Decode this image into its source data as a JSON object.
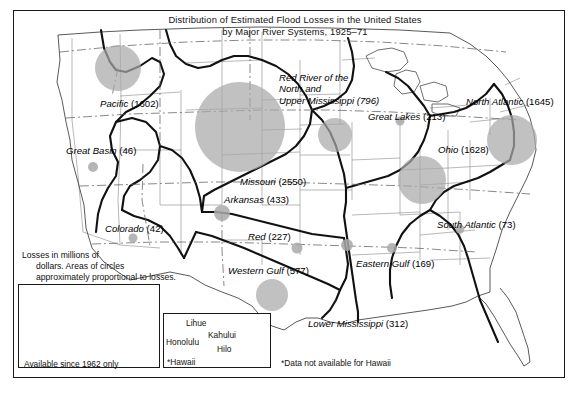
{
  "title": {
    "line1": "Distribution of Estimated Flood Losses in the United States",
    "line2": "by Major River Systems, 1925–71"
  },
  "legend": {
    "line1": "Losses in millions of",
    "line2": "dollars.  Areas of circles",
    "line3": "approximately proportional to losses."
  },
  "insets": {
    "alaska": {
      "region_label": "Alaska",
      "value_label": "(110)",
      "caption": "Available since 1962 only"
    },
    "hawaii": {
      "caption": "*Hawaii",
      "cities": [
        {
          "name": "Lihue"
        },
        {
          "name": "Honolulu"
        },
        {
          "name": "Kahului"
        },
        {
          "name": "Hilo"
        }
      ]
    }
  },
  "footnote": "*Data not available for Hawaii",
  "colors": {
    "circle_fill": "#a9a9a9",
    "frame": "#1a1a1a",
    "basin_line": "#141414",
    "state_line": "#6f6f6f",
    "text": "#000000"
  },
  "chart_data": {
    "type": "map",
    "title": "Distribution of Estimated Flood Losses in the United States by Major River Systems, 1925–71",
    "units": "millions of dollars",
    "encoding": "circle area proportional to losses",
    "categories": [
      "Pacific",
      "Great Basin",
      "Colorado",
      "Missouri",
      "Arkansas",
      "Red",
      "Western Gulf",
      "Red River of the North and Upper Mississippi",
      "Great Lakes",
      "Ohio",
      "North Atlantic",
      "South Atlantic",
      "Eastern Gulf",
      "Lower Mississippi",
      "Alaska"
    ],
    "values": [
      1602,
      46,
      42,
      2550,
      433,
      227,
      577,
      796,
      213,
      1628,
      1645,
      73,
      169,
      312,
      110
    ],
    "regions": [
      {
        "name": "Pacific",
        "value": 1602,
        "label": "Pacific (1602)",
        "label_x": 100,
        "label_y": 98,
        "cx": 118,
        "cy": 68,
        "r": 23
      },
      {
        "name": "Great Basin",
        "value": 46,
        "label": "Great Basin (46)",
        "label_x": 66,
        "label_y": 145,
        "cx": 93,
        "cy": 167,
        "r": 5
      },
      {
        "name": "Colorado",
        "value": 42,
        "label": "Colorado (42)",
        "label_x": 105,
        "label_y": 223,
        "cx": 133,
        "cy": 238,
        "r": 4.5
      },
      {
        "name": "Missouri",
        "value": 2550,
        "label": "Missouri (2550)",
        "label_x": 240,
        "label_y": 176,
        "cx": 240,
        "cy": 127,
        "r": 45
      },
      {
        "name": "Arkansas",
        "value": 433,
        "label": "Arkansas (433)",
        "label_x": 224,
        "label_y": 194,
        "cx": 222,
        "cy": 213,
        "r": 8
      },
      {
        "name": "Red",
        "value": 227,
        "label": "Red (227)",
        "label_x": 248,
        "label_y": 231,
        "cx": 297,
        "cy": 248,
        "r": 5.5
      },
      {
        "name": "Western Gulf",
        "value": 577,
        "label": "Western Gulf (577)",
        "label_x": 228,
        "label_y": 265,
        "cx": 272,
        "cy": 295,
        "r": 16
      },
      {
        "name": "Red River of the North and Upper Mississippi",
        "value": 796,
        "label": "Red River of the",
        "label2": "North and",
        "label3": "Upper Mississippi (796)",
        "label_x": 279,
        "label_y": 72,
        "cx": 335,
        "cy": 135,
        "r": 17
      },
      {
        "name": "Great Lakes",
        "value": 213,
        "label": "Great Lakes (213)",
        "label_x": 368,
        "label_y": 111,
        "cx": 400,
        "cy": 121,
        "r": 4.5
      },
      {
        "name": "Ohio",
        "value": 1628,
        "label": "Ohio (1628)",
        "label_x": 438,
        "label_y": 144,
        "cx": 422,
        "cy": 180,
        "r": 24
      },
      {
        "name": "North Atlantic",
        "value": 1645,
        "label": "North Atlantic (1645)",
        "label_x": 466,
        "label_y": 96,
        "cx": 512,
        "cy": 140,
        "r": 25
      },
      {
        "name": "South Atlantic",
        "value": 73,
        "label": "South Atlantic (73)",
        "label_x": 437,
        "label_y": 219,
        "cx": 460,
        "cy": 229,
        "r": 4.5
      },
      {
        "name": "Eastern Gulf",
        "value": 169,
        "label": "Eastern Gulf (169)",
        "label_x": 356,
        "label_y": 258,
        "cx": 392,
        "cy": 248,
        "r": 5
      },
      {
        "name": "Lower Mississippi",
        "value": 312,
        "label": "Lower Mississippi (312)",
        "label_x": 308,
        "label_y": 318,
        "cx": 347,
        "cy": 245,
        "r": 6
      },
      {
        "name": "Alaska",
        "value": 110,
        "label": "Alaska (110)",
        "label_x": 42,
        "label_y": 306,
        "cx": 97,
        "cy": 312,
        "r": 5
      }
    ]
  }
}
